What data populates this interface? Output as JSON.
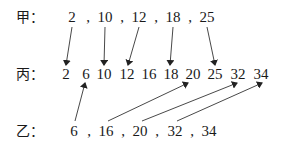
{
  "rows": {
    "jia": {
      "label": "甲：",
      "values": [
        "2",
        "10",
        "12",
        "18",
        "25"
      ]
    },
    "bing": {
      "label": "丙：",
      "values": [
        "2",
        "6",
        "10",
        "12",
        "16",
        "18",
        "20",
        "25",
        "32",
        "34"
      ]
    },
    "yi": {
      "label": "乙：",
      "values": [
        "6",
        "16",
        "20",
        "32",
        "34"
      ]
    }
  },
  "separator": ",",
  "arrows": [
    {
      "from": "甲:2",
      "to": "丙:2"
    },
    {
      "from": "甲:10",
      "to": "丙:10"
    },
    {
      "from": "甲:12",
      "to": "丙:12"
    },
    {
      "from": "甲:18",
      "to": "丙:18"
    },
    {
      "from": "甲:25",
      "to": "丙:25"
    },
    {
      "from": "乙:6",
      "to": "丙:6"
    },
    {
      "from": "乙:16",
      "to": "丙:20"
    },
    {
      "from": "乙:20",
      "to": "丙:32"
    },
    {
      "from": "乙:32",
      "to": "丙:34"
    }
  ],
  "colors": {
    "text": "#1a1a1a",
    "arrow": "#222222",
    "background": "#ffffff"
  }
}
